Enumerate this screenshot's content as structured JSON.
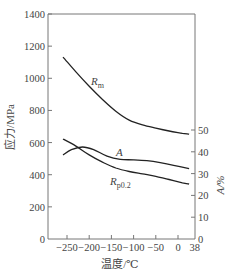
{
  "chart_data": {
    "type": "line",
    "title": "",
    "xlabel": "温度/℃",
    "ylabel": "应力/MPa",
    "y2label": "A/%",
    "xlim": [
      -293,
      38
    ],
    "ylim": [
      0,
      1400
    ],
    "y2lim": [
      0,
      50
    ],
    "x_ticks": [
      -250,
      -200,
      -150,
      -100,
      -50,
      0,
      38
    ],
    "x_tick_labels": [
      "-250",
      "-200",
      "-150",
      "-100",
      "-50",
      "0",
      "38"
    ],
    "y_ticks": [
      0,
      200,
      400,
      600,
      800,
      1000,
      1200,
      1400
    ],
    "y_tick_labels": [
      "0",
      "200",
      "400",
      "600",
      "800",
      "1000",
      "1200",
      "1400"
    ],
    "y2_ticks": [
      0,
      10,
      20,
      30,
      40,
      50
    ],
    "y2_tick_labels": [
      "0",
      "10",
      "20",
      "30",
      "40",
      "50"
    ],
    "grid": false,
    "legend": "inline labels",
    "series": [
      {
        "name": "Rm",
        "label": "R",
        "subscript": "m",
        "axis": "left",
        "x": [
          -259,
          -230,
          -200,
          -170,
          -140,
          -110,
          -80,
          -50,
          -20,
          10,
          25
        ],
        "y": [
          1132,
          1040,
          950,
          868,
          795,
          740,
          710,
          690,
          672,
          658,
          653
        ]
      },
      {
        "name": "Rp0.2",
        "label": "R",
        "subscript": "p0.2",
        "axis": "left",
        "x": [
          -259,
          -230,
          -200,
          -170,
          -140,
          -110,
          -80,
          -50,
          -20,
          10,
          25
        ],
        "y": [
          622,
          578,
          523,
          478,
          442,
          420,
          405,
          390,
          370,
          350,
          342
        ]
      },
      {
        "name": "A",
        "label": "A",
        "subscript": "",
        "axis": "right",
        "x": [
          -259,
          -240,
          -215,
          -190,
          -160,
          -130,
          -100,
          -70,
          -40,
          -10,
          25
        ],
        "y": [
          38.5,
          41.0,
          42.2,
          41.0,
          38.0,
          36.5,
          36.3,
          35.9,
          35.0,
          33.8,
          32.3
        ]
      }
    ]
  }
}
